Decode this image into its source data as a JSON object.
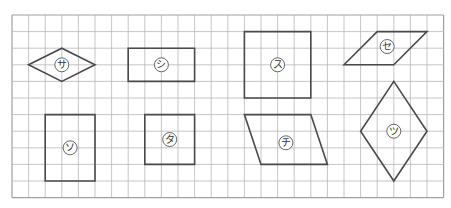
{
  "grid": {
    "origin_x": 12,
    "origin_y": 15,
    "cell": 16.6,
    "cols": 26,
    "rows": 11,
    "line_color": "#b8b8b8",
    "border_color": "#a0a0a0"
  },
  "shape_style": {
    "stroke": "#4a4a4a",
    "stroke_width": 1.6,
    "label_circle_radius": 7,
    "label_circle_stroke": "#555555"
  },
  "shapes": [
    {
      "id": "sa",
      "label": "サ",
      "kind": "rhombus",
      "points": [
        [
          1,
          3
        ],
        [
          3,
          2
        ],
        [
          5,
          3
        ],
        [
          3,
          4
        ]
      ],
      "label_at": [
        3,
        3
      ]
    },
    {
      "id": "shi",
      "label": "シ",
      "kind": "rectangle",
      "points": [
        [
          7,
          2
        ],
        [
          11,
          2
        ],
        [
          11,
          4
        ],
        [
          7,
          4
        ]
      ],
      "label_at": [
        9,
        3
      ]
    },
    {
      "id": "su",
      "label": "ス",
      "kind": "square",
      "points": [
        [
          14,
          1
        ],
        [
          18,
          1
        ],
        [
          18,
          5
        ],
        [
          14,
          5
        ]
      ],
      "label_at": [
        16,
        3
      ]
    },
    {
      "id": "se",
      "label": "セ",
      "kind": "parallelogram",
      "points": [
        [
          20,
          3
        ],
        [
          22,
          1
        ],
        [
          25,
          1
        ],
        [
          23,
          3
        ]
      ],
      "label_at": [
        22.6,
        1.9
      ]
    },
    {
      "id": "so",
      "label": "ソ",
      "kind": "rectangle",
      "points": [
        [
          2,
          6
        ],
        [
          5,
          6
        ],
        [
          5,
          10
        ],
        [
          2,
          10
        ]
      ],
      "label_at": [
        3.5,
        8
      ]
    },
    {
      "id": "ta",
      "label": "タ",
      "kind": "square",
      "points": [
        [
          8,
          6
        ],
        [
          11,
          6
        ],
        [
          11,
          9
        ],
        [
          8,
          9
        ]
      ],
      "label_at": [
        9.5,
        7.5
      ]
    },
    {
      "id": "chi",
      "label": "チ",
      "kind": "parallelogram",
      "points": [
        [
          14,
          6
        ],
        [
          18,
          6
        ],
        [
          19,
          9
        ],
        [
          15,
          9
        ]
      ],
      "label_at": [
        16.5,
        7.7
      ]
    },
    {
      "id": "tsu",
      "label": "ツ",
      "kind": "rhombus",
      "points": [
        [
          23,
          4
        ],
        [
          25,
          7
        ],
        [
          23,
          10
        ],
        [
          21,
          7
        ]
      ],
      "label_at": [
        23,
        7
      ]
    }
  ]
}
